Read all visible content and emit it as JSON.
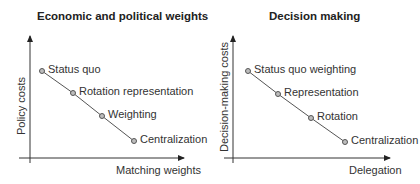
{
  "panels": [
    {
      "title": "Economic and political weights",
      "x_label": "Matching weights",
      "y_label": "Policy costs",
      "points": [
        {
          "label": "Status quo",
          "x": 42,
          "y": 71
        },
        {
          "label": "Rotation representation",
          "x": 73,
          "y": 93
        },
        {
          "label": "Weighting",
          "x": 102,
          "y": 116
        },
        {
          "label": "Centralization",
          "x": 134,
          "y": 141
        }
      ]
    },
    {
      "title": "Decision making",
      "x_label": "Delegation",
      "y_label": "Decision-making costs",
      "points": [
        {
          "label": "Status quo weighting",
          "x": 248,
          "y": 71
        },
        {
          "label": "Representation",
          "x": 278,
          "y": 94
        },
        {
          "label": "Rotation",
          "x": 311,
          "y": 118
        },
        {
          "label": "Centralization",
          "x": 345,
          "y": 142
        }
      ]
    }
  ],
  "colors": {
    "axis": "#333333",
    "line": "#555555",
    "marker_fill": "#bdbdbd",
    "marker_stroke": "#555555"
  }
}
